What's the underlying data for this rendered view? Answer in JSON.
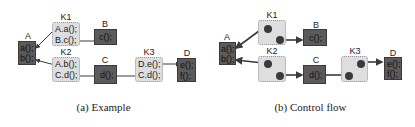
{
  "panels": [
    {
      "caption": "(a) Example",
      "nodes": {
        "A": {
          "label": "A",
          "lines": [
            "a();",
            "b();"
          ]
        },
        "K1": {
          "label": "K1",
          "lines": [
            "A.a();",
            "B.c();"
          ]
        },
        "B": {
          "label": "B",
          "lines": [
            "c();"
          ]
        },
        "K2": {
          "label": "K2",
          "lines": [
            "A.b();",
            "C.d();"
          ]
        },
        "C": {
          "label": "C",
          "lines": [
            "d();"
          ]
        },
        "K3": {
          "label": "K3",
          "lines": [
            "D.e();",
            "C.d();"
          ]
        },
        "D": {
          "label": "D",
          "lines": [
            "e();",
            "f();"
          ]
        }
      }
    },
    {
      "caption": "(b) Control flow",
      "nodes": {
        "A": {
          "label": "A",
          "lines": [
            "a();",
            "b();"
          ]
        },
        "K1": {
          "label": "K1"
        },
        "B": {
          "label": "B",
          "lines": [
            "c();"
          ]
        },
        "K2": {
          "label": "K2"
        },
        "C": {
          "label": "C",
          "lines": [
            "d();"
          ]
        },
        "K3": {
          "label": "K3"
        },
        "D": {
          "label": "D",
          "lines": [
            "e();",
            "f();"
          ]
        }
      }
    }
  ],
  "colors": {
    "connector_box_fill": "#dedede",
    "component_box_fill": "#5b5b5b",
    "edge": "#3a3a3a"
  }
}
